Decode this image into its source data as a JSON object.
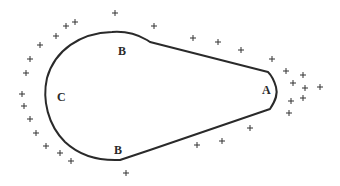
{
  "diagram": {
    "type": "charged conductor (teardrop shape) with surface charge distribution",
    "stroke_color": "#2a2a2a",
    "charge_symbol": "+",
    "labels": [
      {
        "id": "B_top",
        "text": "B",
        "x": 118,
        "y": 51
      },
      {
        "id": "C",
        "text": "C",
        "x": 57,
        "y": 97
      },
      {
        "id": "A",
        "text": "A",
        "x": 262,
        "y": 90
      },
      {
        "id": "B_bottom",
        "text": "B",
        "x": 114,
        "y": 150
      }
    ],
    "charges": [
      {
        "x": 115,
        "y": 13
      },
      {
        "x": 154,
        "y": 26
      },
      {
        "x": 75,
        "y": 22
      },
      {
        "x": 66,
        "y": 26
      },
      {
        "x": 56,
        "y": 36
      },
      {
        "x": 40,
        "y": 45
      },
      {
        "x": 30,
        "y": 59
      },
      {
        "x": 26,
        "y": 73
      },
      {
        "x": 22,
        "y": 94
      },
      {
        "x": 24,
        "y": 106
      },
      {
        "x": 30,
        "y": 119
      },
      {
        "x": 36,
        "y": 133
      },
      {
        "x": 46,
        "y": 146
      },
      {
        "x": 60,
        "y": 153
      },
      {
        "x": 71,
        "y": 161
      },
      {
        "x": 126,
        "y": 173
      },
      {
        "x": 193,
        "y": 38
      },
      {
        "x": 218,
        "y": 42
      },
      {
        "x": 241,
        "y": 50
      },
      {
        "x": 272,
        "y": 59
      },
      {
        "x": 286,
        "y": 71
      },
      {
        "x": 303,
        "y": 75
      },
      {
        "x": 293,
        "y": 83
      },
      {
        "x": 305,
        "y": 88
      },
      {
        "x": 320,
        "y": 87
      },
      {
        "x": 291,
        "y": 101
      },
      {
        "x": 303,
        "y": 98
      },
      {
        "x": 289,
        "y": 113
      },
      {
        "x": 197,
        "y": 145
      },
      {
        "x": 222,
        "y": 141
      },
      {
        "x": 250,
        "y": 128
      }
    ]
  }
}
